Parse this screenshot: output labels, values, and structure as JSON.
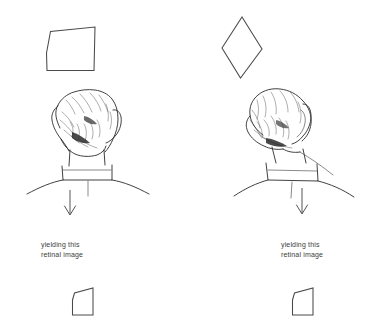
{
  "diagram": {
    "background_color": "#ffffff",
    "ink_color": "#2b2b2b",
    "shape_stroke_color": "#4a4a4a",
    "arrow_color": "#555555",
    "caption_color": "#3b3b3b",
    "panels": [
      {
        "id": "left",
        "stimulus_shape": {
          "name": "tilted-quadrilateral",
          "description": "quadrilateral with slanted top edge, upright viewer",
          "points": "46,52 50,32 95,27 94,70 47,70"
        },
        "observer": {
          "name": "upright-head",
          "description": "back view of a head, upright, seen from behind with shoulders"
        },
        "arrow": {
          "name": "downward-arrow",
          "direction": "down"
        },
        "caption": "yielding this\nretinal image",
        "retinal_shape": {
          "name": "small-quadrilateral",
          "points": "72,300 74,293 93,288 93,315 72,315"
        }
      },
      {
        "id": "right",
        "stimulus_shape": {
          "name": "diamond-rhombus",
          "description": "diamond / rhombus standing on a point, with tilted viewer",
          "points": "242,17 262,49 240,78 222,48"
        },
        "observer": {
          "name": "tilted-head",
          "description": "back view of a head tilted to the viewer's left, with shoulders"
        },
        "arrow": {
          "name": "downward-arrow",
          "direction": "down"
        },
        "caption": "yielding this\nretinal image",
        "retinal_shape": {
          "name": "small-quadrilateral",
          "points": "292,300 294,293 313,288 313,315 292,315"
        }
      }
    ]
  }
}
